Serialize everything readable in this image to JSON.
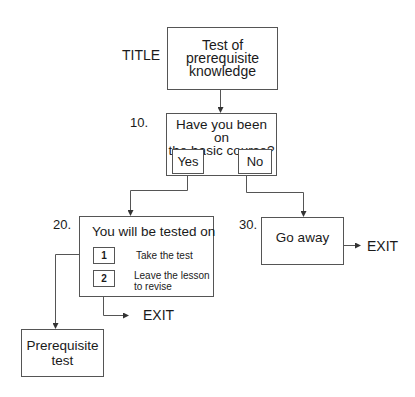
{
  "diagram": {
    "type": "flowchart",
    "nodes": {
      "title": {
        "side_label": "TITLE",
        "text_lines": [
          "Test of",
          "prerequisite",
          "knowledge"
        ]
      },
      "q10": {
        "number": "10.",
        "question_lines": [
          "Have you been on",
          "the basic course?"
        ],
        "option_yes": "Yes",
        "option_no": "No"
      },
      "n20": {
        "number": "20.",
        "heading": "You will be tested on",
        "option1_key": "1",
        "option1_text": "Take the test",
        "option2_key": "2",
        "option2_text_lines": [
          "Leave the lesson",
          "to revise"
        ]
      },
      "n30": {
        "number": "30.",
        "text": "Go away"
      },
      "prereq": {
        "text_lines": [
          "Prerequisite",
          "test"
        ]
      },
      "exit_from_20": "EXIT",
      "exit_from_30": "EXIT"
    },
    "edges": [
      {
        "from": "title",
        "to": "q10"
      },
      {
        "from": "q10.yes",
        "to": "n20"
      },
      {
        "from": "q10.no",
        "to": "n30"
      },
      {
        "from": "n20.option1",
        "to": "prereq"
      },
      {
        "from": "n20.option2",
        "to": "exit"
      },
      {
        "from": "n30",
        "to": "exit"
      }
    ],
    "colors": {
      "line": "#555555",
      "text": "#1a1a1a",
      "background": "#ffffff"
    }
  }
}
